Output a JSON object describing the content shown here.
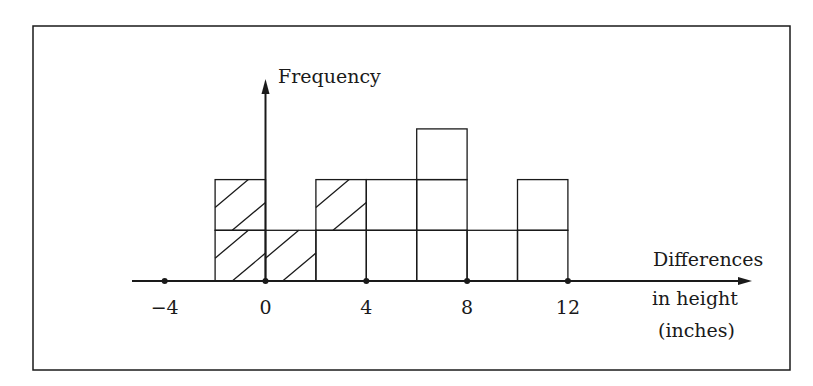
{
  "chart_data": {
    "type": "bar",
    "subtype": "histogram",
    "title": "",
    "xlabel": "Differences in height (inches)",
    "xlabel_lines": [
      "Differences",
      "in height",
      "(inches)"
    ],
    "ylabel": "Frequency",
    "bin_width": 2,
    "bins": [
      {
        "from": -2,
        "to": 0,
        "count": 2,
        "hatched_cells": [
          1,
          2
        ]
      },
      {
        "from": 0,
        "to": 2,
        "count": 1,
        "hatched_cells": [
          1
        ]
      },
      {
        "from": 2,
        "to": 4,
        "count": 2,
        "hatched_cells": [
          2
        ]
      },
      {
        "from": 4,
        "to": 6,
        "count": 2,
        "hatched_cells": []
      },
      {
        "from": 6,
        "to": 8,
        "count": 3,
        "hatched_cells": []
      },
      {
        "from": 8,
        "to": 10,
        "count": 1,
        "hatched_cells": []
      },
      {
        "from": 10,
        "to": 12,
        "count": 2,
        "hatched_cells": []
      }
    ],
    "categories": [
      "-2 to 0",
      "0 to 2",
      "2 to 4",
      "4 to 6",
      "6 to 8",
      "8 to 10",
      "10 to 12"
    ],
    "values": [
      2,
      1,
      2,
      2,
      3,
      1,
      2
    ],
    "x_ticks": [
      -4,
      0,
      4,
      8,
      12
    ],
    "x_tick_labels": [
      "−4",
      "0",
      "4",
      "8",
      "12"
    ],
    "xlim": [
      -5.3,
      16
    ],
    "ylim": [
      0,
      4
    ],
    "grid": false,
    "legend": null,
    "annotations": [
      "Hatched cells mark negative / non-positive differences"
    ]
  },
  "labels": {
    "y_axis": "Frequency",
    "x_axis_line1": "Differences",
    "x_axis_line2": "in height",
    "x_axis_line3": "(inches)"
  },
  "colors": {
    "ink": "#1a1a1a",
    "background": "#ffffff"
  }
}
